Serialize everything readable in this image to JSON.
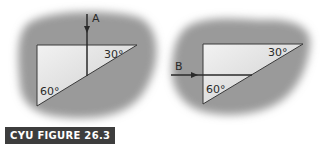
{
  "caption": "CYU FIGURE 26.3",
  "figures": [
    {
      "id": "left",
      "ray_label": "A",
      "ray_direction": "down",
      "angle_top_right": "30°",
      "angle_bottom_left": "60°"
    },
    {
      "id": "right",
      "ray_label": "B",
      "ray_direction": "right",
      "angle_top_right": "30°",
      "angle_bottom_left": "60°"
    }
  ],
  "colors": {
    "blob": "#9a9a9a",
    "prism_fill": "#e6e6e6",
    "line": "#2a2a2a",
    "caption_bg": "#3d3d3d"
  }
}
